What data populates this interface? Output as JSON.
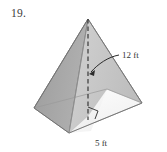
{
  "figure": {
    "problem_number": "19.",
    "shape_name": "square-pyramid",
    "labels": {
      "height_label": "12 ft",
      "base_edge_label": "5 ft"
    },
    "annotations": {
      "right_angle_marker": "right-angle",
      "height_line_style": "dashed",
      "leader_arrow": "curved-arrow-to-height-line"
    },
    "colors": {
      "left_face": "#a6a6a6",
      "back_left_face": "#9a9a9a",
      "right_face": "#c9c9c9",
      "front_face": "#f2f2f2",
      "base_top": "#fbfbfb",
      "outline": "#6e6e6e",
      "dashed_line": "#2b2b2b",
      "text": "#333333",
      "background": "#ffffff"
    },
    "geometry": {
      "apex": [
        88,
        19
      ],
      "base_left": [
        34,
        108
      ],
      "base_right": [
        142,
        103
      ],
      "base_front": [
        69,
        133
      ],
      "base_back": [
        107,
        89
      ],
      "height_foot": [
        88,
        116
      ]
    }
  }
}
